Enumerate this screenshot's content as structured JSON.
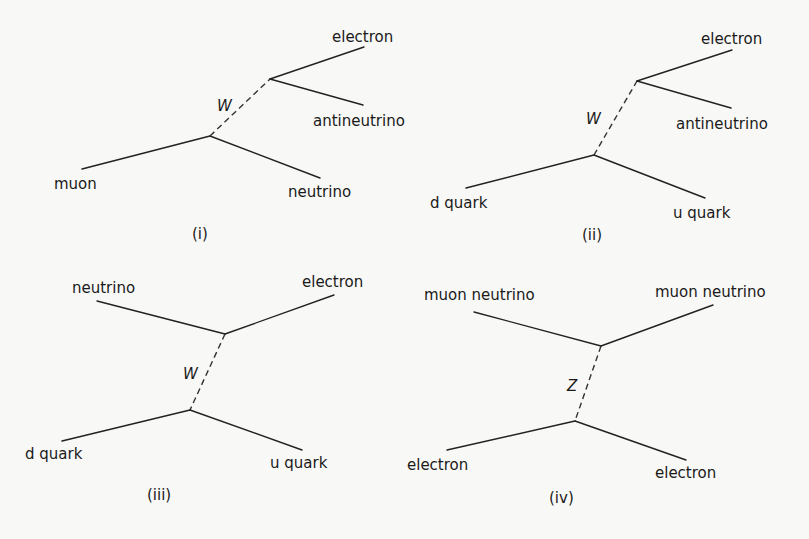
{
  "diagrams": [
    {
      "id": "i",
      "caption": "(i)",
      "boson": "W",
      "particles": {
        "incoming_lower": "muon",
        "outgoing_lower": "neutrino",
        "outgoing_upper_1": "electron",
        "outgoing_upper_2": "antineutrino"
      }
    },
    {
      "id": "ii",
      "caption": "(ii)",
      "boson": "W",
      "particles": {
        "incoming_lower": "d quark",
        "outgoing_lower": "u quark",
        "outgoing_upper_1": "electron",
        "outgoing_upper_2": "antineutrino"
      }
    },
    {
      "id": "iii",
      "caption": "(iii)",
      "boson": "W",
      "particles": {
        "incoming_upper": "neutrino",
        "outgoing_upper": "electron",
        "incoming_lower": "d quark",
        "outgoing_lower": "u quark"
      }
    },
    {
      "id": "iv",
      "caption": "(iv)",
      "boson": "Z",
      "particles": {
        "incoming_upper": "muon neutrino",
        "outgoing_upper": "muon neutrino",
        "incoming_lower": "electron",
        "outgoing_lower": "electron"
      }
    }
  ]
}
